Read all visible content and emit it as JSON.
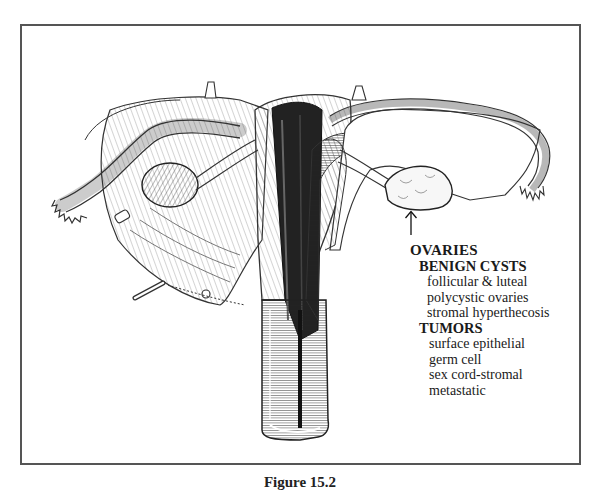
{
  "figure": {
    "caption": "Figure 15.2",
    "illustration": "Anatomical drawing of uterus, fallopian tubes, ovaries and vagina (cutaway)",
    "arrow_target": "ovary"
  },
  "legend": {
    "title": "OVARIES",
    "groups": [
      {
        "heading": "BENIGN CYSTS",
        "items": [
          "follicular & luteal",
          "polycystic ovaries",
          "stromal hyperthecosis"
        ]
      },
      {
        "heading": "TUMORS",
        "items": [
          "surface epithelial",
          "germ cell",
          "sex cord-stromal",
          "metastatic"
        ]
      }
    ]
  },
  "colors": {
    "frame": "#555555",
    "ink": "#1a1a1a",
    "background": "#ffffff"
  }
}
